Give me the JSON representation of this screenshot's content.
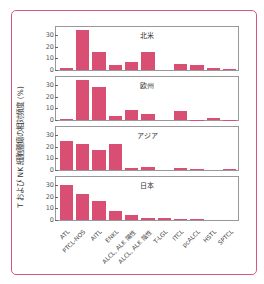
{
  "chart_data": {
    "type": "bar",
    "ylabel": "T および NK 細胞腫瘍の相対頻度 (%)",
    "xlabel": "",
    "ylim": [
      0,
      35
    ],
    "yticks": [
      0,
      10,
      20,
      30
    ],
    "categories": [
      "ATL",
      "PTCL-NOS",
      "AITL",
      "ENKL",
      "ALCL, ALK 陽性",
      "ALCL, ALK 陰性",
      "T-LGL",
      "ITCL",
      "pcALCL",
      "HSTL",
      "SPTCL"
    ],
    "series": [
      {
        "name": "北米",
        "values": [
          1.5,
          34,
          15,
          4.5,
          7,
          15,
          0,
          5,
          4.5,
          2,
          0.5
        ]
      },
      {
        "name": "欧州",
        "values": [
          0.5,
          34,
          28,
          3.5,
          8.5,
          5.5,
          0,
          8,
          0.3,
          1.5,
          0.3
        ]
      },
      {
        "name": "アジア",
        "values": [
          25,
          22,
          17.5,
          22,
          2,
          2.5,
          0,
          1.3,
          0.5,
          0,
          0.7
        ]
      },
      {
        "name": "日本",
        "values": [
          30,
          22.5,
          16,
          7.5,
          4,
          2,
          1.8,
          0.5,
          0.5,
          0,
          0
        ]
      }
    ],
    "layout": {
      "panels": "stacked vertically, shared x-axis",
      "grid": false,
      "legend": "panel titles"
    },
    "bar_color": "#d94f73",
    "frame_color": "#d45a7c"
  },
  "panels": [
    {
      "title": "北米"
    },
    {
      "title": "欧州"
    },
    {
      "title": "アジア"
    },
    {
      "title": "日本"
    }
  ],
  "y_axis_label": "T および NK 細胞腫瘍の相対頻度 (%)",
  "tick_labels": [
    "0",
    "10",
    "20",
    "30"
  ]
}
